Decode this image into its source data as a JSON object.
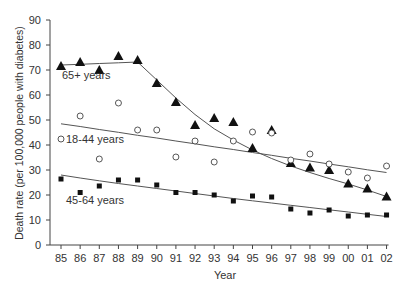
{
  "chart_data": {
    "type": "scatter",
    "title": "",
    "xlabel": "Year",
    "ylabel": "Death rate (per 100,000 people with diabetes)",
    "ylim": [
      0,
      90
    ],
    "yticks": [
      0,
      10,
      20,
      30,
      40,
      50,
      60,
      70,
      80,
      90
    ],
    "categories": [
      "85",
      "86",
      "87",
      "88",
      "89",
      "90",
      "91",
      "92",
      "93",
      "94",
      "95",
      "96",
      "97",
      "98",
      "99",
      "00",
      "01",
      "02"
    ],
    "grid": false,
    "legend": "inline labels",
    "series": [
      {
        "name": "65+ years",
        "marker": "triangle-filled",
        "values": [
          71.6,
          73.2,
          70.0,
          75.6,
          74.0,
          64.8,
          57.2,
          48.0,
          50.8,
          49.2,
          38.8,
          46.0,
          32.8,
          31.0,
          30.0,
          24.6,
          22.6,
          19.4
        ],
        "trend": [
          72,
          72.3,
          72.6,
          72.9,
          73.2,
          66,
          58.8,
          52.2,
          46.5,
          42,
          38,
          34.6,
          31.6,
          29,
          26.6,
          24.4,
          22,
          19.4
        ]
      },
      {
        "name": "18-44 years",
        "marker": "circle-open",
        "values": [
          42.4,
          51.6,
          34.4,
          56.8,
          46.0,
          46.0,
          35.2,
          41.6,
          33.2,
          41.6,
          45.2,
          44.8,
          34.0,
          36.4,
          32.4,
          29.2,
          26.8,
          31.6
        ],
        "trend": [
          48.5,
          47.4,
          46.2,
          45.1,
          43.9,
          42.8,
          41.6,
          40.5,
          39.3,
          38.2,
          37.0,
          35.9,
          34.7,
          33.6,
          32.4,
          31.3,
          30.1,
          29.0
        ]
      },
      {
        "name": "45-64 years",
        "marker": "square-filled",
        "values": [
          26.4,
          21.0,
          23.6,
          26.0,
          26.0,
          24.0,
          21.0,
          21.0,
          20.0,
          17.6,
          19.6,
          19.2,
          14.4,
          12.8,
          14.0,
          11.6,
          12.0,
          12.0
        ],
        "trend": [
          28.0,
          26.8,
          25.7,
          24.6,
          23.6,
          22.6,
          21.6,
          20.6,
          19.6,
          18.6,
          17.7,
          16.8,
          15.9,
          15.0,
          14.1,
          13.2,
          12.3,
          11.4
        ]
      }
    ],
    "labels": [
      {
        "text": "65+ years",
        "x": 62,
        "y": 79
      },
      {
        "text": "18-44 years",
        "x": 66,
        "y": 143
      },
      {
        "text": "45-64 years",
        "x": 66,
        "y": 204
      }
    ]
  }
}
